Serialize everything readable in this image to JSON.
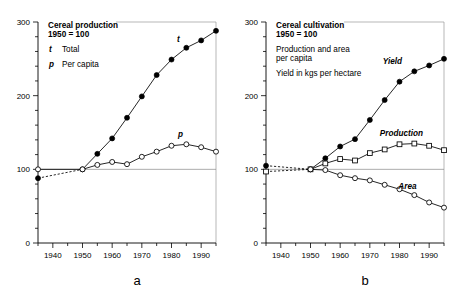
{
  "figure": {
    "panel_letters": [
      "a",
      "b"
    ]
  },
  "panel_a": {
    "letter": "a",
    "legend": {
      "title_line1": "Cereal production",
      "title_line2": "1950 = 100",
      "entries": [
        {
          "key": "t",
          "label": "Total"
        },
        {
          "key": "p",
          "label": "Per capita"
        }
      ]
    },
    "series_labels": {
      "total": "t",
      "per_capita": "p"
    }
  },
  "panel_b": {
    "letter": "b",
    "legend": {
      "title_line1": "Cereal cultivation",
      "title_line2": "1950 = 100",
      "note_line1": "Production and area",
      "note_line2": "per capita",
      "note_line3": "Yield in kgs per hectare"
    },
    "series_labels": {
      "yield": "Yield",
      "production": "Production",
      "area": "Area"
    }
  },
  "chart_data": [
    {
      "type": "line",
      "panel": "a",
      "title": "Cereal production  1950 = 100",
      "xlabel": "",
      "ylabel": "",
      "xlim": [
        1935,
        1995
      ],
      "ylim": [
        0,
        300
      ],
      "xticks": [
        1940,
        1950,
        1960,
        1970,
        1980,
        1990
      ],
      "xticklabels": [
        "1940",
        "1950",
        "1960",
        "1970",
        "1980",
        "1990"
      ],
      "xminor_step": 5,
      "yticks": [
        0,
        100,
        200,
        300
      ],
      "yticklabels": [
        "0",
        "100",
        "200",
        "300"
      ],
      "yminor_step": 20,
      "grid": false,
      "reference_line_y": 100,
      "legend_position": "top-left",
      "series": [
        {
          "name": "t",
          "label": "Total",
          "marker": "filled-circle",
          "x": [
            1935,
            1950,
            1955,
            1960,
            1965,
            1970,
            1975,
            1980,
            1985,
            1990,
            1995
          ],
          "values": [
            88,
            100,
            121,
            142,
            170,
            199,
            228,
            249,
            265,
            275,
            288
          ],
          "dashed_segment": {
            "x": [
              1935,
              1950
            ],
            "values": [
              88,
              100
            ]
          }
        },
        {
          "name": "p",
          "label": "Per capita",
          "marker": "open-circle",
          "x": [
            1935,
            1950,
            1955,
            1960,
            1965,
            1970,
            1975,
            1980,
            1985,
            1990,
            1995
          ],
          "values": [
            100,
            100,
            106,
            110,
            107,
            117,
            124,
            132,
            134,
            130,
            124
          ],
          "dashed_segment": null
        }
      ]
    },
    {
      "type": "line",
      "panel": "b",
      "title": "Cereal cultivation  1950 = 100",
      "xlabel": "",
      "ylabel": "",
      "xlim": [
        1935,
        1995
      ],
      "ylim": [
        0,
        300
      ],
      "xticks": [
        1940,
        1950,
        1960,
        1970,
        1980,
        1990
      ],
      "xticklabels": [
        "1940",
        "1950",
        "1960",
        "1970",
        "1980",
        "1990"
      ],
      "xminor_step": 5,
      "yticks": [
        0,
        100,
        200,
        300
      ],
      "yticklabels": [
        "0",
        "100",
        "200",
        "300"
      ],
      "yminor_step": 20,
      "grid": false,
      "reference_line_y": 100,
      "legend_position": "top-left",
      "series": [
        {
          "name": "Yield",
          "label": "Yield",
          "marker": "filled-circle",
          "x": [
            1935,
            1950,
            1955,
            1960,
            1965,
            1970,
            1975,
            1980,
            1985,
            1990,
            1995
          ],
          "values": [
            105,
            100,
            115,
            131,
            141,
            167,
            194,
            219,
            233,
            241,
            250
          ],
          "dashed_segment": {
            "x": [
              1935,
              1950
            ],
            "values": [
              105,
              100
            ]
          }
        },
        {
          "name": "Production",
          "label": "Production",
          "marker": "open-square",
          "x": [
            1935,
            1950,
            1955,
            1960,
            1965,
            1970,
            1975,
            1980,
            1985,
            1990,
            1995
          ],
          "values": [
            97,
            100,
            108,
            114,
            112,
            122,
            127,
            134,
            135,
            132,
            126
          ],
          "dashed_segment": {
            "x": [
              1935,
              1950
            ],
            "values": [
              97,
              100
            ]
          }
        },
        {
          "name": "Area",
          "label": "Area",
          "marker": "open-circle",
          "x": [
            1950,
            1955,
            1960,
            1965,
            1970,
            1975,
            1980,
            1985,
            1990,
            1995
          ],
          "values": [
            100,
            99,
            92,
            88,
            85,
            79,
            73,
            65,
            55,
            48
          ],
          "dashed_segment": null
        }
      ]
    }
  ]
}
